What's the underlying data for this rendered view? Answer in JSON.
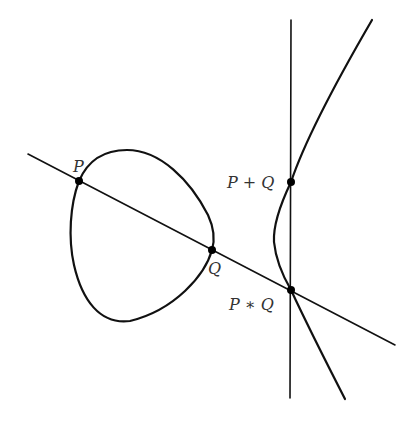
{
  "diagram": {
    "colors": {
      "stroke": "#111111",
      "point": "#000000",
      "label": "#333333",
      "background": "#ffffff"
    },
    "curve": {
      "components": [
        "bounded-oval",
        "unbounded-branch"
      ]
    },
    "secant_line": {
      "through": [
        "P",
        "Q",
        "P*Q"
      ]
    },
    "vertical_line": {
      "through": [
        "P*Q",
        "P+Q"
      ]
    },
    "points": [
      {
        "id": "P",
        "label": "P"
      },
      {
        "id": "Q",
        "label": "Q"
      },
      {
        "id": "PstarQ",
        "label": "P ∗ Q"
      },
      {
        "id": "PplusQ",
        "label": "P + Q"
      }
    ]
  }
}
